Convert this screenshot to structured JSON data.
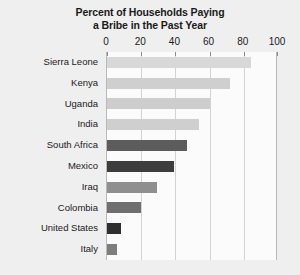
{
  "chart_data": {
    "type": "bar",
    "orientation": "horizontal",
    "title": "Percent of Households Paying a Bribe in the Past Year",
    "title_lines": [
      "Percent of Households Paying",
      "a Bribe in the Past Year"
    ],
    "xlabel": "",
    "ylabel": "",
    "xlim": [
      0,
      100
    ],
    "xticks": [
      0,
      20,
      40,
      60,
      80,
      100
    ],
    "xtick_labels": [
      "0",
      "20",
      "40",
      "60",
      "80",
      "100"
    ],
    "grid": true,
    "legend": "none",
    "categories": [
      "Sierra Leone",
      "Kenya",
      "Uganda",
      "India",
      "South Africa",
      "Mexico",
      "Iraq",
      "Colombia",
      "United States",
      "Italy"
    ],
    "values": [
      84,
      72,
      60,
      54,
      47,
      39,
      29,
      20,
      8,
      6
    ],
    "bar_colors": [
      "#d8d8d8",
      "#cfcfcf",
      "#cdcdcd",
      "#cfcfcf",
      "#5c5c5c",
      "#3d3d3d",
      "#8f8f8f",
      "#6f6f6f",
      "#2f2f2f",
      "#7d7d7d"
    ]
  },
  "colors": {
    "page_background": "#efefef",
    "plot_background": "#fbfbfb",
    "gridline": "#d2d2d2",
    "axis_border": "#b9b9b9",
    "text": "#1a1a1a"
  }
}
